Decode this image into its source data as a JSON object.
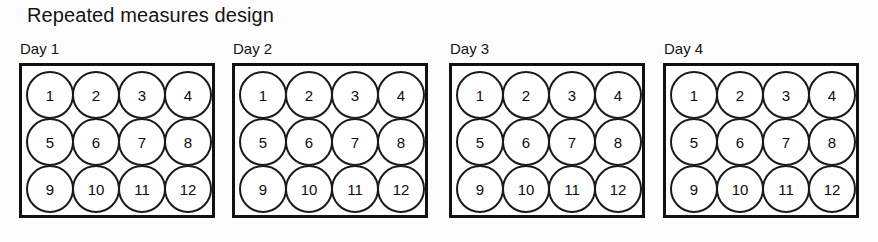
{
  "figure": {
    "title": "Repeated measures design",
    "ink_color": "#111111",
    "background_color": "#fdfdfd"
  },
  "grid_layout": {
    "columns": 4,
    "rows": 3,
    "circle_count_per_panel": 12
  },
  "panels": [
    {
      "label": "Day 1",
      "subjects": [
        "1",
        "2",
        "3",
        "4",
        "5",
        "6",
        "7",
        "8",
        "9",
        "10",
        "11",
        "12"
      ]
    },
    {
      "label": "Day 2",
      "subjects": [
        "1",
        "2",
        "3",
        "4",
        "5",
        "6",
        "7",
        "8",
        "9",
        "10",
        "11",
        "12"
      ]
    },
    {
      "label": "Day 3",
      "subjects": [
        "1",
        "2",
        "3",
        "4",
        "5",
        "6",
        "7",
        "8",
        "9",
        "10",
        "11",
        "12"
      ]
    },
    {
      "label": "Day 4",
      "subjects": [
        "1",
        "2",
        "3",
        "4",
        "5",
        "6",
        "7",
        "8",
        "9",
        "10",
        "11",
        "12"
      ]
    }
  ]
}
